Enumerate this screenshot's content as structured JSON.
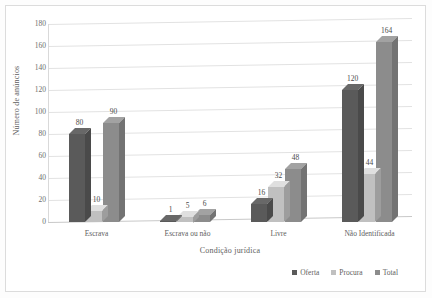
{
  "chart_data": {
    "type": "bar",
    "title": "",
    "subtitle": "",
    "xlabel": "Condição jurídica",
    "ylabel": "Número de anúncios",
    "categories": [
      "Escrava",
      "Escrava ou não",
      "Livre",
      "Não Identificada"
    ],
    "series": [
      {
        "name": "Oferta",
        "values": [
          80,
          1,
          16,
          120
        ],
        "color": "#5a5a5a"
      },
      {
        "name": "Procura",
        "values": [
          10,
          5,
          32,
          44
        ],
        "color": "#c0c0c0"
      },
      {
        "name": "Total",
        "values": [
          90,
          6,
          48,
          164
        ],
        "color": "#8c8c8c"
      }
    ],
    "ylim": [
      0,
      180
    ],
    "yticks": [
      0,
      20,
      40,
      60,
      80,
      100,
      120,
      140,
      160,
      180
    ],
    "grid": true,
    "grid_axis": "y",
    "legend_position": "bottom-right",
    "style": "3d-clustered-column",
    "data_labels": true
  },
  "legend": {
    "items": [
      {
        "label": "Oferta",
        "color": "#5a5a5a"
      },
      {
        "label": "Procura",
        "color": "#c0c0c0"
      },
      {
        "label": "Total",
        "color": "#8c8c8c"
      }
    ]
  },
  "axes": {
    "y_title": "Número de anúncios",
    "x_title": "Condição jurídica"
  }
}
